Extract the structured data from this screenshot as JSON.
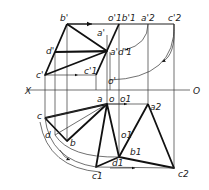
{
  "figure": {
    "type": "descriptive-geometry-projection",
    "axis": {
      "left_label": "X",
      "right_label": "O"
    },
    "front_view_labels": {
      "b_prime": "b'",
      "d_prime": "d'",
      "c_prime": "c'",
      "a_prime": "a'",
      "o1_prime_b1_prime": "o'1b'1",
      "a2_prime": "a'2",
      "c2_prime": "c'2",
      "a_prime_d1_prime": "a'd'1",
      "c1_prime": "c'1",
      "o_prime": "o'"
    },
    "top_view_labels": {
      "a": "a",
      "o": "o",
      "o1_top": "o1",
      "a2": "a2",
      "c": "c",
      "d": "d",
      "b": "b",
      "o1_mid": "o1",
      "b1": "b1",
      "c1": "c1",
      "d1": "d1",
      "c2": "c2"
    },
    "colors": {
      "line": "#111111",
      "background": "#ffffff"
    }
  }
}
